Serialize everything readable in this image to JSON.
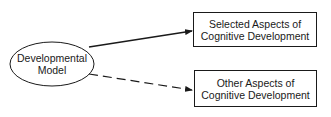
{
  "diagram": {
    "source_node": {
      "shape": "ellipse",
      "lines": [
        "Developmental",
        "Model"
      ]
    },
    "target_nodes": [
      {
        "shape": "rectangle",
        "lines": [
          "Selected Aspects of",
          "Cognitive Development"
        ]
      },
      {
        "shape": "rectangle",
        "lines": [
          "Other Aspects of",
          "Cognitive Development"
        ]
      }
    ],
    "edges": [
      {
        "from": "Developmental Model",
        "to": "Selected Aspects of Cognitive Development",
        "style": "solid"
      },
      {
        "from": "Developmental Model",
        "to": "Other Aspects of Cognitive Development",
        "style": "dashed"
      }
    ],
    "colors": {
      "stroke": "#1a1a1a",
      "background": "#ffffff"
    }
  }
}
